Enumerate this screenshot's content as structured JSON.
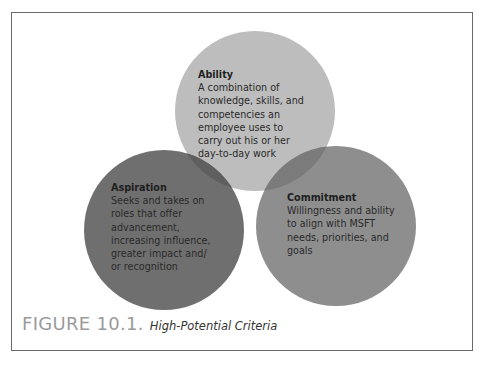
{
  "figure": {
    "number_label": "FIGURE 10.1.",
    "caption": "High-Potential Criteria"
  },
  "circles": [
    {
      "id": "ability",
      "title": "Ability",
      "description_lines": [
        "A combination of",
        "knowledge, skills, and",
        "competencies an",
        "employee uses to",
        "carry out his or her",
        "day-to-day work"
      ],
      "color": "#bdbdbd"
    },
    {
      "id": "aspiration",
      "title": "Aspiration",
      "description_lines": [
        "Seeks and takes on",
        "roles that offer",
        "advancement,",
        "increasing influence,",
        "greater impact and/",
        "or recognition"
      ],
      "color": "#6f6f6f"
    },
    {
      "id": "commitment",
      "title": "Commitment",
      "description_lines": [
        "Willingness and ability",
        "to align with MSFT",
        "needs, priorities, and",
        "goals"
      ],
      "color": "#8e8e8e"
    }
  ],
  "overlap_colors": {
    "ability_aspiration": "#5e5e5e",
    "ability_commitment": "#7a7a7a"
  }
}
